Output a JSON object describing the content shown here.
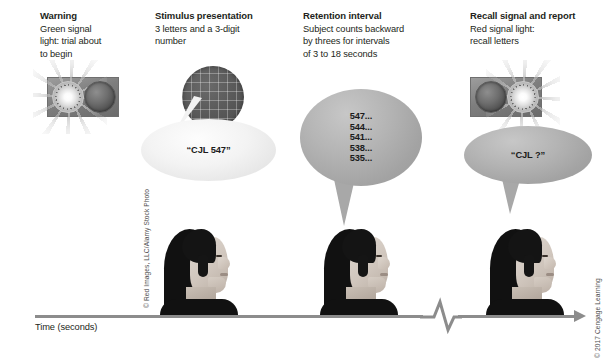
{
  "figure": {
    "axis_label": "Time (seconds)",
    "photo_credit": "© Red Images, LLC/Alamy Stock Photo",
    "publisher_credit": "© 2017 Cengage Learning"
  },
  "panels": [
    {
      "id": "warning",
      "title": "Warning",
      "description": "Green signal\nlight: trial about\nto begin",
      "signal": {
        "lit_side": "left",
        "lit_color": "#7dd957",
        "off_color": "#4a4a4a"
      }
    },
    {
      "id": "stimulus-presentation",
      "title": "Stimulus presentation",
      "description": "3 letters and a 3-digit\nnumber",
      "bubble_text": "“CJL 547”"
    },
    {
      "id": "retention-interval",
      "title": "Retention interval",
      "description": "Subject counts backward\nby threes for intervals\nof 3 to 18 seconds",
      "bubble_text": "547...\n544...\n541...\n538...\n535..."
    },
    {
      "id": "recall-signal-and-report",
      "title": "Recall signal and report",
      "description": "Red signal light:\nrecall letters",
      "signal": {
        "lit_side": "right",
        "lit_color": "#e04a3a",
        "off_color": "#4a4a4a"
      },
      "bubble_text": "“CJL ?”"
    }
  ],
  "countdown": {
    "start": 547,
    "step": -3,
    "values": [
      547,
      544,
      541,
      538,
      535
    ]
  },
  "colors": {
    "text": "#231f20",
    "timeline": "#8c8c8c",
    "bubble_gray": "#b4b4b4",
    "bubble_light": "#f0f0f0"
  }
}
